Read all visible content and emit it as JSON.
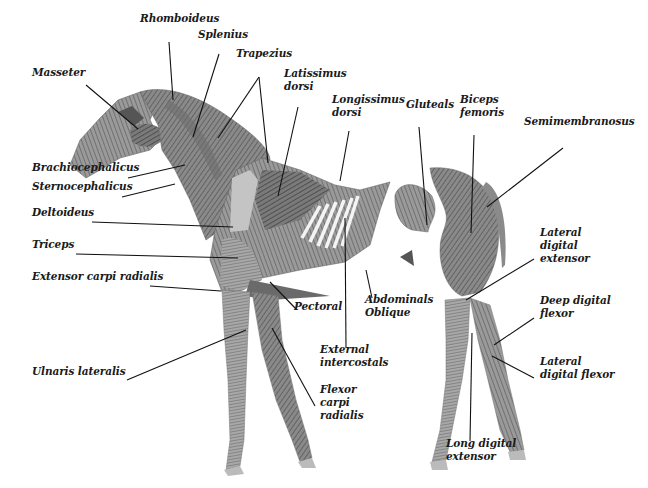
{
  "diagram": {
    "colors": {
      "muscle_dark": "#5a5a5a",
      "muscle_mid": "#8c8c8c",
      "muscle_light": "#c4c4c4",
      "line": "#111111",
      "background": "#ffffff"
    },
    "labels": [
      {
        "id": "rhomboideus",
        "text": "Rhomboideus",
        "x": 140,
        "y": 22
      },
      {
        "id": "splenius",
        "text": "Splenius",
        "x": 198,
        "y": 38
      },
      {
        "id": "trapezius",
        "text": "Trapezius",
        "x": 236,
        "y": 57
      },
      {
        "id": "latissimus-dorsi",
        "text": "Latissimus\ndorsi",
        "x": 284,
        "y": 77
      },
      {
        "id": "masseter",
        "text": "Masseter",
        "x": 32,
        "y": 76
      },
      {
        "id": "longissimus-dorsi",
        "text": "Longissimus\ndorsi",
        "x": 332,
        "y": 103
      },
      {
        "id": "gluteals",
        "text": "Gluteals",
        "x": 406,
        "y": 108
      },
      {
        "id": "biceps-femoris",
        "text": "Biceps\nfemoris",
        "x": 460,
        "y": 103
      },
      {
        "id": "semimembranosus",
        "text": "Semimembranosus",
        "x": 524,
        "y": 125
      },
      {
        "id": "brachiocephalicus",
        "text": "Brachiocephalicus",
        "x": 32,
        "y": 171
      },
      {
        "id": "sternocephalicus",
        "text": "Sternocephalicus",
        "x": 32,
        "y": 190
      },
      {
        "id": "deltoideus",
        "text": "Deltoideus",
        "x": 32,
        "y": 216
      },
      {
        "id": "triceps",
        "text": "Triceps",
        "x": 32,
        "y": 248
      },
      {
        "id": "extensor-carpi-radialis",
        "text": "Extensor carpi radialis",
        "x": 32,
        "y": 280
      },
      {
        "id": "lateral-digital-extensor",
        "text": "Lateral\ndigital\nextensor",
        "x": 540,
        "y": 236
      },
      {
        "id": "pectoral",
        "text": "Pectoral",
        "x": 294,
        "y": 310
      },
      {
        "id": "abdominals-oblique",
        "text": "Abdominals\nOblique",
        "x": 365,
        "y": 303
      },
      {
        "id": "deep-digital-flexor",
        "text": "Deep digital\nflexor",
        "x": 540,
        "y": 304
      },
      {
        "id": "external-intercostals",
        "text": "External\nintercostals",
        "x": 320,
        "y": 353
      },
      {
        "id": "lateral-digital-flexor",
        "text": "Lateral\ndigital flexor",
        "x": 540,
        "y": 365
      },
      {
        "id": "ulnaris-lateralis",
        "text": "Ulnaris lateralis",
        "x": 32,
        "y": 375
      },
      {
        "id": "flexor-carpi-radialis",
        "text": "Flexor\ncarpi\nradialis",
        "x": 320,
        "y": 393
      },
      {
        "id": "long-digital-extensor",
        "text": "Long digital\nextensor",
        "x": 446,
        "y": 447
      }
    ],
    "leader_lines": [
      {
        "for": "masseter",
        "x1": 86,
        "y1": 85,
        "x2": 138,
        "y2": 129
      },
      {
        "for": "rhomboideus",
        "x1": 169,
        "y1": 42,
        "x2": 173,
        "y2": 100
      },
      {
        "for": "splenius",
        "x1": 219,
        "y1": 54,
        "x2": 193,
        "y2": 137
      },
      {
        "for": "trapezius",
        "x1": 259,
        "y1": 77,
        "x2": 218,
        "y2": 138
      },
      {
        "for": "trapezius",
        "x1": 259,
        "y1": 77,
        "x2": 268,
        "y2": 163
      },
      {
        "for": "latissimus-dorsi",
        "x1": 298,
        "y1": 107,
        "x2": 278,
        "y2": 196
      },
      {
        "for": "longissimus-dorsi",
        "x1": 349,
        "y1": 131,
        "x2": 340,
        "y2": 181
      },
      {
        "for": "gluteals",
        "x1": 419,
        "y1": 127,
        "x2": 427,
        "y2": 225
      },
      {
        "for": "biceps-femoris",
        "x1": 474,
        "y1": 135,
        "x2": 471,
        "y2": 233
      },
      {
        "for": "semimembranosus",
        "x1": 563,
        "y1": 148,
        "x2": 487,
        "y2": 207
      },
      {
        "for": "brachiocephalicus",
        "x1": 128,
        "y1": 178,
        "x2": 185,
        "y2": 165
      },
      {
        "for": "sternocephalicus",
        "x1": 122,
        "y1": 197,
        "x2": 175,
        "y2": 184
      },
      {
        "for": "deltoideus",
        "x1": 92,
        "y1": 222,
        "x2": 233,
        "y2": 227
      },
      {
        "for": "triceps",
        "x1": 76,
        "y1": 254,
        "x2": 238,
        "y2": 258
      },
      {
        "for": "extensor-carpi-radialis",
        "x1": 150,
        "y1": 286,
        "x2": 221,
        "y2": 291
      },
      {
        "for": "pectoral",
        "x1": 296,
        "y1": 309,
        "x2": 270,
        "y2": 282
      },
      {
        "for": "abdominals-oblique",
        "x1": 372,
        "y1": 298,
        "x2": 366,
        "y2": 270
      },
      {
        "for": "external-intercostals",
        "x1": 346,
        "y1": 348,
        "x2": 345,
        "y2": 218
      },
      {
        "for": "flexor-carpi-radialis",
        "x1": 315,
        "y1": 406,
        "x2": 272,
        "y2": 328
      },
      {
        "for": "ulnaris-lateralis",
        "x1": 127,
        "y1": 380,
        "x2": 246,
        "y2": 330
      },
      {
        "for": "lateral-digital-extensor",
        "x1": 534,
        "y1": 259,
        "x2": 466,
        "y2": 300
      },
      {
        "for": "deep-digital-flexor",
        "x1": 534,
        "y1": 318,
        "x2": 494,
        "y2": 345
      },
      {
        "for": "lateral-digital-flexor",
        "x1": 534,
        "y1": 378,
        "x2": 492,
        "y2": 356
      },
      {
        "for": "long-digital-extensor",
        "x1": 470,
        "y1": 441,
        "x2": 472,
        "y2": 333
      }
    ]
  }
}
